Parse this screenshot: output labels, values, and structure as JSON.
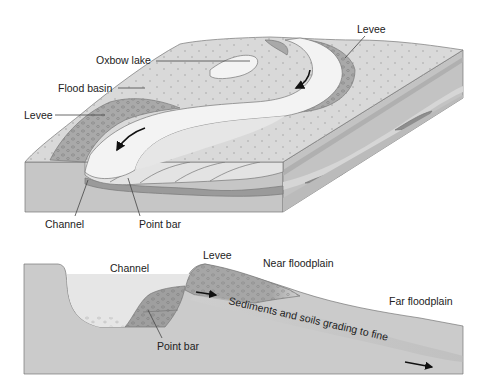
{
  "figure": {
    "block_diagram": {
      "labels": {
        "oxbow_lake": "Oxbow lake",
        "flood_basin": "Flood basin",
        "levee_left": "Levee",
        "levee_right": "Levee",
        "channel": "Channel",
        "point_bar": "Point bar"
      },
      "flow_arrows": 2
    },
    "cross_section": {
      "labels": {
        "channel": "Channel",
        "levee": "Levee",
        "near_floodplain": "Near floodplain",
        "far_floodplain": "Far floodplain",
        "point_bar": "Point bar",
        "grading": "Sediments and soils grading to fine"
      }
    }
  },
  "colors": {
    "surface": "#d9d9d9",
    "side_face": "#c4c4c4",
    "channel_water": "#f2f2f2",
    "levee": "#a9a9a9",
    "lens": "#8f8f8f",
    "outline": "#6b6b6b",
    "text": "#222222"
  }
}
